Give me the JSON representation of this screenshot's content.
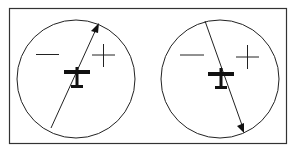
{
  "diagram": {
    "type": "wind-indicator-comparison",
    "frame_color": "#333333",
    "panels": [
      {
        "name": "left",
        "minus_label": "minus",
        "plus_label": "plus",
        "arrow_direction": "up-right",
        "aircraft": "airplane-top-view"
      },
      {
        "name": "right",
        "minus_label": "minus",
        "plus_label": "plus",
        "arrow_direction": "down-right",
        "aircraft": "airplane-top-view"
      }
    ]
  }
}
